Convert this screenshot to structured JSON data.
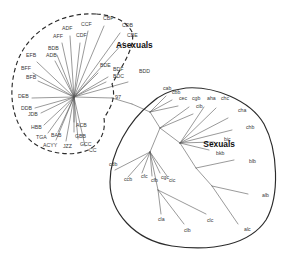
{
  "figure": {
    "type": "phylogenetic-network",
    "background_color": "#ffffff",
    "branch_color": "#555555",
    "hull_color": "#2b2b2b",
    "label_color": "#3a3a3a"
  },
  "groups": [
    {
      "id": "asexuals",
      "label": "Asexuals",
      "outline_style": "dashed",
      "label_x": 116,
      "label_y": 48,
      "root_x": 74,
      "root_y": 97
    },
    {
      "id": "sexuals",
      "label": "Sexuals",
      "outline_style": "solid",
      "label_x": 235,
      "label_y": 147,
      "root_x": 180,
      "root_y": 143
    }
  ],
  "support_values": [
    {
      "label": "97",
      "x": 115,
      "y": 99
    }
  ],
  "asexual_tips": [
    {
      "label": "CCF",
      "lx": 81,
      "ly": 26,
      "tx": 88,
      "ty": 31
    },
    {
      "label": "CBF",
      "lx": 103,
      "ly": 20,
      "tx": 104,
      "ty": 26
    },
    {
      "label": "CDB",
      "lx": 122,
      "ly": 27,
      "tx": 120,
      "ty": 33
    },
    {
      "label": "CBE",
      "lx": 127,
      "ly": 37,
      "tx": 124,
      "ty": 42
    },
    {
      "label": "ADF",
      "lx": 62,
      "ly": 30,
      "tx": 70,
      "ty": 36
    },
    {
      "label": "AFF",
      "lx": 53,
      "ly": 38,
      "tx": 62,
      "ty": 43
    },
    {
      "label": "CDF",
      "lx": 76,
      "ly": 37,
      "tx": 80,
      "ty": 43
    },
    {
      "label": "BDB",
      "lx": 48,
      "ly": 50,
      "tx": 57,
      "ty": 55
    },
    {
      "label": "ADB",
      "lx": 46,
      "ly": 57,
      "tx": 55,
      "ty": 61
    },
    {
      "label": "EFB",
      "lx": 26,
      "ly": 57,
      "tx": 37,
      "ty": 62
    },
    {
      "label": "BFF",
      "lx": 21,
      "ly": 70,
      "tx": 33,
      "ty": 73
    },
    {
      "label": "BFB",
      "lx": 26,
      "ly": 79,
      "tx": 38,
      "ty": 81
    },
    {
      "label": "DEB",
      "lx": 18,
      "ly": 98,
      "tx": 32,
      "ty": 98
    },
    {
      "label": "DDB",
      "lx": 21,
      "ly": 110,
      "tx": 35,
      "ty": 108
    },
    {
      "label": "JDB",
      "lx": 28,
      "ly": 116,
      "tx": 41,
      "ty": 113
    },
    {
      "label": "HBB",
      "lx": 31,
      "ly": 129,
      "tx": 44,
      "ty": 125
    },
    {
      "label": "TGA",
      "lx": 36,
      "ly": 139,
      "tx": 48,
      "ty": 133
    },
    {
      "label": "BAB",
      "lx": 51,
      "ly": 137,
      "tx": 58,
      "ty": 132
    },
    {
      "label": "ACYY",
      "lx": 43,
      "ly": 147,
      "tx": 56,
      "ty": 140
    },
    {
      "label": "JZZ",
      "lx": 63,
      "ly": 148,
      "tx": 66,
      "ty": 141
    },
    {
      "label": "ACB",
      "lx": 76,
      "ly": 127,
      "tx": 74,
      "ty": 122
    },
    {
      "label": "GBB",
      "lx": 75,
      "ly": 138,
      "tx": 74,
      "ty": 132
    },
    {
      "label": "GCC",
      "lx": 80,
      "ly": 146,
      "tx": 78,
      "ty": 139
    },
    {
      "label": "CC",
      "lx": 89,
      "ly": 152,
      "tx": 85,
      "ty": 146
    },
    {
      "label": "BDE",
      "lx": 100,
      "ly": 67,
      "tx": 98,
      "ty": 73
    },
    {
      "label": "BDF",
      "lx": 113,
      "ly": 71,
      "tx": 108,
      "ty": 77
    },
    {
      "label": "BDC",
      "lx": 113,
      "ly": 78,
      "tx": 106,
      "ty": 82
    },
    {
      "label": "BDD",
      "lx": 139,
      "ly": 73,
      "tx": 128,
      "ty": 82
    }
  ],
  "sexual_tips": [
    {
      "label": "cab",
      "lx": 163,
      "ly": 90,
      "tx": 166,
      "ty": 96
    },
    {
      "label": "cbb",
      "lx": 172,
      "ly": 94,
      "tx": 172,
      "ty": 100
    },
    {
      "label": "cec",
      "lx": 179,
      "ly": 100,
      "tx": 178,
      "ty": 106
    },
    {
      "label": "cgb",
      "lx": 192,
      "ly": 100,
      "tx": 189,
      "ty": 107
    },
    {
      "label": "cib",
      "lx": 196,
      "ly": 108,
      "tx": 193,
      "ty": 114
    },
    {
      "label": "aha",
      "lx": 207,
      "ly": 100,
      "tx": 204,
      "ty": 107
    },
    {
      "label": "chc",
      "lx": 221,
      "ly": 100,
      "tx": 216,
      "ty": 108
    },
    {
      "label": "cha",
      "lx": 238,
      "ly": 112,
      "tx": 228,
      "ty": 118
    },
    {
      "label": "chb",
      "lx": 246,
      "ly": 129,
      "tx": 232,
      "ty": 130
    },
    {
      "label": "bic",
      "lx": 224,
      "ly": 141,
      "tx": 214,
      "ty": 142
    },
    {
      "label": "bkb",
      "lx": 216,
      "ly": 155,
      "tx": 209,
      "ty": 150
    },
    {
      "label": "blb",
      "lx": 249,
      "ly": 163,
      "tx": 234,
      "ty": 160
    },
    {
      "label": "alb",
      "lx": 262,
      "ly": 197,
      "tx": 248,
      "ty": 194
    },
    {
      "label": "alc",
      "lx": 244,
      "ly": 231,
      "tx": 238,
      "ty": 224
    },
    {
      "label": "clc",
      "lx": 207,
      "ly": 222,
      "tx": 206,
      "ty": 214
    },
    {
      "label": "clb",
      "lx": 184,
      "ly": 232,
      "tx": 184,
      "ty": 224
    },
    {
      "label": "cla",
      "lx": 158,
      "ly": 221,
      "tx": 161,
      "ty": 214
    },
    {
      "label": "cdb",
      "lx": 109,
      "ly": 166,
      "tx": 115,
      "ty": 170
    },
    {
      "label": "ccb",
      "lx": 124,
      "ly": 181,
      "tx": 128,
      "ty": 177
    },
    {
      "label": "cfc",
      "lx": 141,
      "ly": 178,
      "tx": 142,
      "ty": 173
    },
    {
      "label": "cfb",
      "lx": 151,
      "ly": 182,
      "tx": 152,
      "ty": 176
    },
    {
      "label": "cgc",
      "lx": 161,
      "ly": 179,
      "tx": 160,
      "ly2": 0,
      "ty": 173
    },
    {
      "label": "cic",
      "lx": 169,
      "ly": 182,
      "tx": 167,
      "ty": 176
    }
  ],
  "hulls": {
    "asexual_path": "M 96 14 C 62 12 30 30 18 60 C 8 86 10 116 26 136 C 40 153 70 158 88 150 C 100 144 106 132 104 118 C 112 106 116 96 112 84 C 122 66 136 46 132 32 C 126 20 112 15 96 14 Z",
    "sexual_path": "M 150 104 C 130 120 110 152 110 182 C 110 212 134 240 172 246 C 214 252 250 244 266 220 C 280 196 278 150 264 124 C 250 100 214 86 186 88 C 170 90 158 96 150 104 Z"
  },
  "branches": {
    "asexual_edges": [
      [
        74,
        97,
        88,
        31
      ],
      [
        74,
        97,
        104,
        26
      ],
      [
        74,
        97,
        120,
        33
      ],
      [
        74,
        97,
        124,
        42
      ],
      [
        74,
        97,
        70,
        36
      ],
      [
        74,
        97,
        62,
        43
      ],
      [
        74,
        97,
        80,
        43
      ],
      [
        74,
        97,
        57,
        55
      ],
      [
        74,
        97,
        55,
        61
      ],
      [
        74,
        97,
        37,
        62
      ],
      [
        74,
        97,
        33,
        73
      ],
      [
        74,
        97,
        38,
        81
      ],
      [
        74,
        97,
        32,
        98
      ],
      [
        74,
        97,
        35,
        108
      ],
      [
        74,
        97,
        41,
        113
      ],
      [
        74,
        97,
        44,
        125
      ],
      [
        74,
        97,
        48,
        133
      ],
      [
        74,
        97,
        58,
        132
      ],
      [
        74,
        97,
        56,
        140
      ],
      [
        74,
        97,
        66,
        141
      ],
      [
        74,
        97,
        74,
        122
      ],
      [
        74,
        97,
        74,
        132
      ],
      [
        74,
        97,
        78,
        139
      ],
      [
        74,
        97,
        85,
        146
      ],
      [
        74,
        97,
        98,
        73
      ],
      [
        74,
        97,
        108,
        77
      ],
      [
        74,
        97,
        106,
        82
      ],
      [
        74,
        97,
        128,
        82
      ]
    ],
    "spine": [
      [
        74,
        97,
        112,
        98
      ],
      [
        112,
        98,
        132,
        104
      ],
      [
        132,
        104,
        150,
        112
      ]
    ],
    "sexual_edges": [
      [
        150,
        112,
        166,
        96
      ],
      [
        150,
        112,
        172,
        100
      ],
      [
        150,
        112,
        178,
        106
      ],
      [
        150,
        112,
        160,
        128
      ],
      [
        160,
        128,
        189,
        107
      ],
      [
        160,
        128,
        193,
        114
      ],
      [
        160,
        128,
        180,
        143
      ],
      [
        180,
        143,
        204,
        107
      ],
      [
        180,
        143,
        216,
        108
      ],
      [
        180,
        143,
        228,
        118
      ],
      [
        180,
        143,
        232,
        130
      ],
      [
        180,
        143,
        214,
        142
      ],
      [
        180,
        143,
        209,
        150
      ],
      [
        180,
        143,
        196,
        168
      ],
      [
        196,
        168,
        234,
        160
      ],
      [
        196,
        168,
        212,
        186
      ],
      [
        212,
        186,
        248,
        194
      ],
      [
        212,
        186,
        238,
        224
      ],
      [
        160,
        128,
        150,
        152
      ],
      [
        150,
        152,
        115,
        170
      ],
      [
        150,
        152,
        128,
        177
      ],
      [
        150,
        152,
        142,
        173
      ],
      [
        150,
        152,
        152,
        176
      ],
      [
        150,
        152,
        160,
        173
      ],
      [
        150,
        152,
        167,
        176
      ],
      [
        150,
        152,
        158,
        190
      ],
      [
        158,
        190,
        161,
        214
      ],
      [
        158,
        190,
        184,
        224
      ],
      [
        158,
        190,
        206,
        214
      ]
    ]
  }
}
